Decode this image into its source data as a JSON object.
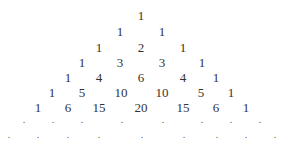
{
  "triangle": {
    "title": "Pascal's triangle",
    "rows": [
      {
        "y": 9,
        "items": [
          {
            "v": "1",
            "x": 141
          }
        ]
      },
      {
        "y": 25,
        "items": [
          {
            "v": "1",
            "x": 120
          },
          {
            "v": "1",
            "x": 162
          }
        ]
      },
      {
        "y": 41,
        "items": [
          {
            "v": "1",
            "x": 99
          },
          {
            "v": "2",
            "x": 141
          },
          {
            "v": "1",
            "x": 183
          }
        ]
      },
      {
        "y": 56,
        "items": [
          {
            "v": "1",
            "x": 82
          },
          {
            "v": "3",
            "x": 120
          },
          {
            "v": "3",
            "x": 162
          },
          {
            "v": "1",
            "x": 202
          }
        ]
      },
      {
        "y": 71,
        "items": [
          {
            "v": "1",
            "x": 68
          },
          {
            "v": "4",
            "x": 99
          },
          {
            "v": "6",
            "x": 141
          },
          {
            "v": "4",
            "x": 183
          },
          {
            "v": "1",
            "x": 216
          }
        ]
      },
      {
        "y": 86,
        "items": [
          {
            "v": "1",
            "x": 52
          },
          {
            "v": "5",
            "x": 82
          },
          {
            "v": "10",
            "x": 121
          },
          {
            "v": "10",
            "x": 162
          },
          {
            "v": "5",
            "x": 201
          },
          {
            "v": "1",
            "x": 231
          }
        ]
      },
      {
        "y": 101,
        "items": [
          {
            "v": "1",
            "x": 38
          },
          {
            "v": "6",
            "x": 68
          },
          {
            "v": "15",
            "x": 99
          },
          {
            "v": "20",
            "x": 141
          },
          {
            "v": "15",
            "x": 183
          },
          {
            "v": "6",
            "x": 216
          },
          {
            "v": "1",
            "x": 246
          }
        ]
      }
    ],
    "dot_rows": [
      {
        "y": 115,
        "items": [
          {
            "v": ".",
            "x": 24
          },
          {
            "v": ".",
            "x": 53
          },
          {
            "v": ".",
            "x": 82
          },
          {
            "v": ".",
            "x": 122
          },
          {
            "v": ".",
            "x": 163
          },
          {
            "v": ".",
            "x": 202
          },
          {
            "v": ".",
            "x": 231
          },
          {
            "v": ".",
            "x": 260
          }
        ]
      },
      {
        "y": 130,
        "items": [
          {
            "v": ".",
            "x": 9
          },
          {
            "v": ".",
            "x": 38
          },
          {
            "v": ".",
            "x": 68
          },
          {
            "v": ".",
            "x": 99
          },
          {
            "v": ".",
            "x": 142
          },
          {
            "v": ".",
            "x": 184
          },
          {
            "v": ".",
            "x": 217
          },
          {
            "v": ".",
            "x": 246
          },
          {
            "v": ".",
            "x": 275
          }
        ]
      }
    ]
  }
}
